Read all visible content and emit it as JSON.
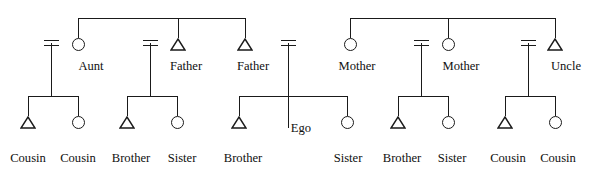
{
  "diagram": {
    "type": "kinship-pedigree",
    "symbol_legend": {
      "triangle": "male",
      "circle": "female",
      "double-bar": "marriage"
    },
    "colors": {
      "line": "#1a1a1a",
      "text": "#101010",
      "background": "#ffffff"
    },
    "parents": [
      {
        "id": "aunt",
        "label": "Aunt",
        "symbol": "circle"
      },
      {
        "id": "father1",
        "label": "Father",
        "symbol": "triangle"
      },
      {
        "id": "father2",
        "label": "Father",
        "symbol": "triangle"
      },
      {
        "id": "mother1",
        "label": "Mother",
        "symbol": "circle"
      },
      {
        "id": "mother2",
        "label": "Mother",
        "symbol": "circle"
      },
      {
        "id": "uncle",
        "label": "Uncle",
        "symbol": "triangle"
      }
    ],
    "children": [
      {
        "id": "cousin1",
        "label": "Cousin",
        "symbol": "triangle"
      },
      {
        "id": "cousin2",
        "label": "Cousin",
        "symbol": "circle"
      },
      {
        "id": "brother1",
        "label": "Brother",
        "symbol": "triangle"
      },
      {
        "id": "sister1",
        "label": "Sister",
        "symbol": "circle"
      },
      {
        "id": "brother2",
        "label": "Brother",
        "symbol": "triangle"
      },
      {
        "id": "ego",
        "label": "Ego",
        "symbol": "none"
      },
      {
        "id": "sister2",
        "label": "Sister",
        "symbol": "circle"
      },
      {
        "id": "brother3",
        "label": "Brother",
        "symbol": "triangle"
      },
      {
        "id": "sister3",
        "label": "Sister",
        "symbol": "circle"
      },
      {
        "id": "cousin3",
        "label": "Cousin",
        "symbol": "triangle"
      },
      {
        "id": "cousin4",
        "label": "Cousin",
        "symbol": "circle"
      }
    ]
  }
}
